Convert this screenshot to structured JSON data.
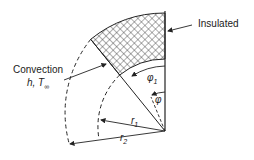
{
  "diagram": {
    "labels": {
      "insulated": "Insulated",
      "convection": "Convection",
      "convection_params_h": "h, T",
      "convection_params_sub": "∞",
      "phi1": "φ",
      "phi1_sub": "1",
      "phi": "φ",
      "r1": "r",
      "r1_sub": "1",
      "r2": "r",
      "r2_sub": "2"
    },
    "geometry": {
      "center": [
        165,
        131
      ],
      "r1": 72,
      "r2": 118,
      "phi1_deg": 39
    },
    "colors": {
      "line": "#222222",
      "hatch": "#333333",
      "background": "#ffffff"
    }
  }
}
